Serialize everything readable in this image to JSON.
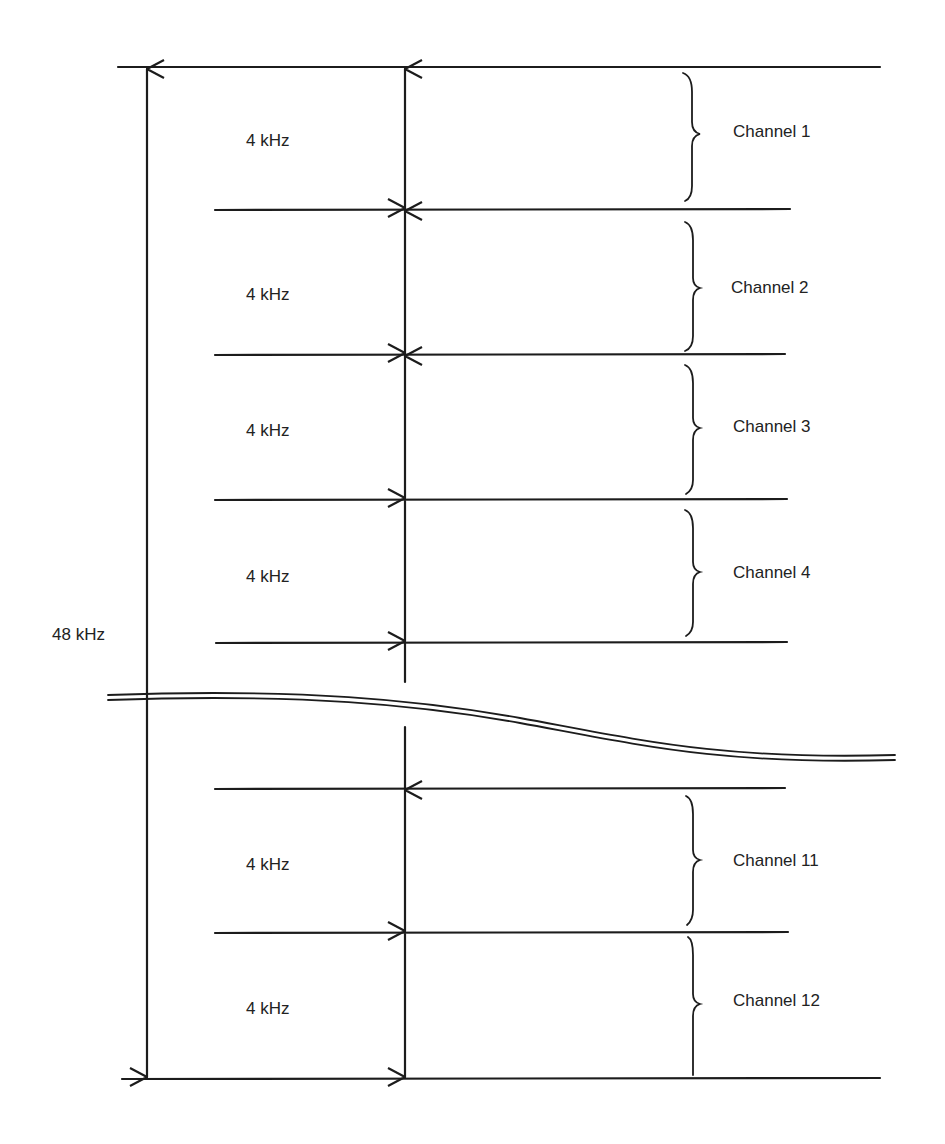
{
  "diagram": {
    "title": "",
    "total_bandwidth_label": "48 kHz",
    "channel_bandwidth_label": "4 kHz",
    "colors": {
      "ink": "#1c1c1c",
      "background": "#ffffff"
    },
    "channels": [
      {
        "name": "Channel 1",
        "bandwidth": "4 kHz"
      },
      {
        "name": "Channel 2",
        "bandwidth": "4 kHz"
      },
      {
        "name": "Channel 3",
        "bandwidth": "4 kHz"
      },
      {
        "name": "Channel 4",
        "bandwidth": "4 kHz"
      },
      {
        "name": "Channel 11",
        "bandwidth": "4 kHz"
      },
      {
        "name": "Channel 12",
        "bandwidth": "4 kHz"
      }
    ],
    "break_indicator": "omitted channels 5-10 (wavy break line)"
  }
}
